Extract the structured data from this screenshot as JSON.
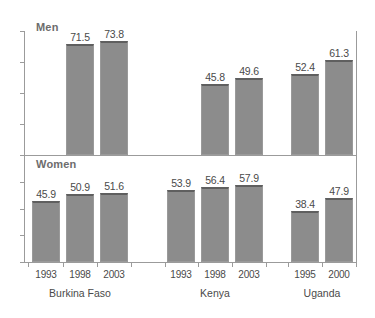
{
  "chart_data": {
    "type": "bar",
    "title": "",
    "subtitle": "",
    "xlabel": "",
    "ylabel": "",
    "grid": false,
    "legend_position": "none",
    "panels": [
      {
        "name": "men",
        "label": "Men",
        "ylim": [
          0,
          80
        ],
        "direction": "down"
      },
      {
        "name": "women",
        "label": "Women",
        "ylim": [
          0,
          80
        ],
        "direction": "up"
      }
    ],
    "groups": [
      {
        "country": "Burkina Faso",
        "years": [
          "1993",
          "1998",
          "2003"
        ],
        "men": [
          null,
          71.5,
          73.8
        ],
        "women": [
          45.9,
          50.9,
          51.6
        ]
      },
      {
        "country": "Kenya",
        "years": [
          "1993",
          "1998",
          "2003"
        ],
        "men": [
          null,
          45.8,
          49.6
        ],
        "women": [
          53.9,
          56.4,
          57.9
        ]
      },
      {
        "country": "Uganda",
        "years": [
          "1995",
          "2000"
        ],
        "men": [
          52.4,
          61.3
        ],
        "women": [
          38.4,
          47.9
        ]
      }
    ],
    "categories": [
      "Burkina Faso 1993",
      "Burkina Faso 1998",
      "Burkina Faso 2003",
      "Kenya 1993",
      "Kenya 1998",
      "Kenya 2003",
      "Uganda 1995",
      "Uganda 2000"
    ],
    "series": [
      {
        "name": "Men",
        "values": [
          null,
          71.5,
          73.8,
          null,
          45.8,
          49.6,
          52.4,
          61.3
        ]
      },
      {
        "name": "Women",
        "values": [
          45.9,
          50.9,
          51.6,
          53.9,
          56.4,
          57.9,
          38.4,
          47.9
        ]
      }
    ],
    "colors": {
      "bar_fill": "#8c8c8c",
      "bar_border": "#5f5f5f",
      "axis": "#9b9b9b",
      "text": "#4a4a4a",
      "panel_label": "#6d6d6d",
      "background": "#ffffff"
    }
  }
}
